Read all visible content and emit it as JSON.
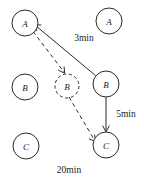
{
  "figure": {
    "title": "",
    "background_color": "#ffffff",
    "stroke_color": "#2b2b2b",
    "width": 144,
    "height": 180
  },
  "nodes": [
    {
      "id": "A-left",
      "label": "A",
      "cx": 25,
      "cy": 23,
      "r": 13,
      "style": "solid"
    },
    {
      "id": "A-right",
      "label": "A",
      "cx": 109,
      "cy": 21,
      "r": 13,
      "style": "solid"
    },
    {
      "id": "B-left",
      "label": "B",
      "cx": 25,
      "cy": 87,
      "r": 13,
      "style": "solid"
    },
    {
      "id": "B-middle",
      "label": "B",
      "cx": 67,
      "cy": 86,
      "r": 12,
      "style": "dashed"
    },
    {
      "id": "B-right",
      "label": "B",
      "cx": 106,
      "cy": 84,
      "r": 13,
      "style": "solid"
    },
    {
      "id": "C-left",
      "label": "C",
      "cx": 26,
      "cy": 146,
      "r": 13,
      "style": "solid"
    },
    {
      "id": "C-right",
      "label": "C",
      "cx": 106,
      "cy": 145,
      "r": 13,
      "style": "solid"
    }
  ],
  "edges": [
    {
      "id": "edge-Bright-to-Aleft",
      "from": "B-right",
      "to": "A-left",
      "style": "solid",
      "arrow": "to"
    },
    {
      "id": "edge-Aleft-to-Bmid",
      "from": "A-left",
      "to": "B-middle",
      "style": "dashed",
      "arrow": "to"
    },
    {
      "id": "edge-Bmid-to-Cright",
      "from": "B-middle",
      "to": "C-right",
      "style": "dashed",
      "arrow": "to"
    },
    {
      "id": "edge-Bright-to-Cright",
      "from": "B-right",
      "to": "C-right",
      "style": "solid",
      "arrow": "to"
    }
  ],
  "edge_labels": [
    {
      "id": "label-3min",
      "text": "3min",
      "x": 84,
      "y": 38,
      "for_edge": "edge-Bright-to-Aleft"
    },
    {
      "id": "label-5min",
      "text": "5min",
      "x": 126,
      "y": 114,
      "for_edge": "edge-Bright-to-Cright"
    },
    {
      "id": "label-20min",
      "text": "20min",
      "x": 69,
      "y": 170,
      "for_edge": "edge-Bmid-to-Cright"
    }
  ]
}
